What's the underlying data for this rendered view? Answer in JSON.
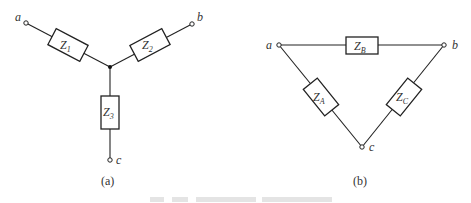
{
  "figure": {
    "panel_a": {
      "caption": "(a)",
      "type": "wye (star) connection",
      "terminals": {
        "a": "a",
        "b": "b",
        "c": "c"
      },
      "impedances": [
        {
          "main": "Z",
          "sub": "1",
          "between": [
            "a",
            "center"
          ]
        },
        {
          "main": "Z",
          "sub": "2",
          "between": [
            "b",
            "center"
          ]
        },
        {
          "main": "Z",
          "sub": "3",
          "between": [
            "c",
            "center"
          ]
        }
      ]
    },
    "panel_b": {
      "caption": "(b)",
      "type": "delta connection",
      "terminals": {
        "a": "a",
        "b": "b",
        "c": "c"
      },
      "impedances": [
        {
          "main": "Z",
          "sub": "B",
          "between": [
            "a",
            "b"
          ]
        },
        {
          "main": "Z",
          "sub": "A",
          "between": [
            "a",
            "c"
          ]
        },
        {
          "main": "Z",
          "sub": "C",
          "between": [
            "b",
            "c"
          ]
        }
      ]
    }
  },
  "colors": {
    "line": "#222222",
    "text": "#333333",
    "background": "#ffffff"
  }
}
